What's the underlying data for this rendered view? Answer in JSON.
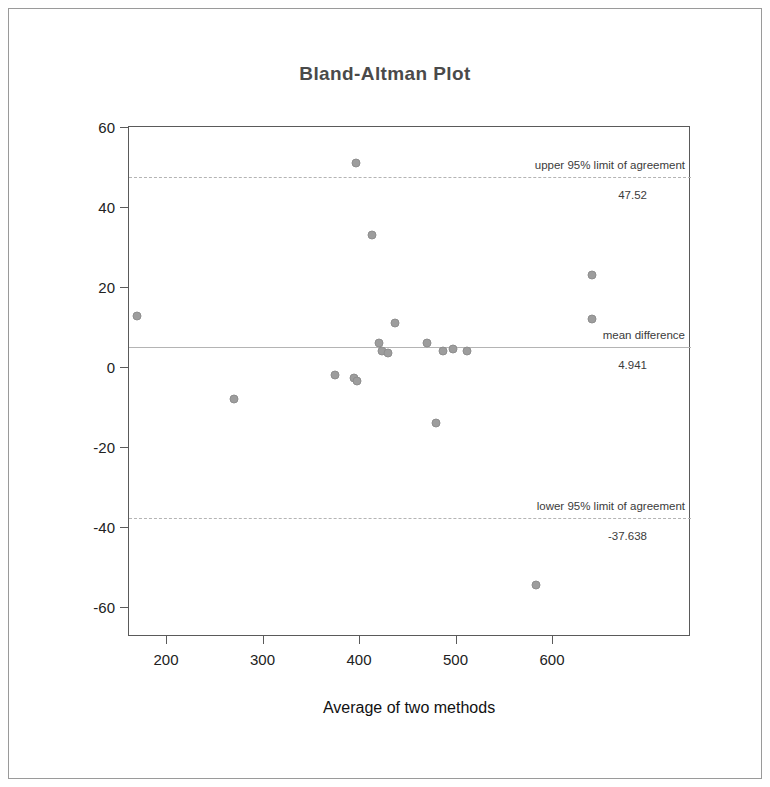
{
  "chart_data": {
    "type": "scatter",
    "title": "Bland-Altman Plot",
    "xlabel": "Average of two methods",
    "ylabel": "Difference between two methods",
    "xlim": [
      130,
      682
    ],
    "ylim": [
      -67,
      62
    ],
    "xticks": [
      200,
      300,
      400,
      500,
      600
    ],
    "yticks": [
      60,
      40,
      20,
      0,
      -20,
      -40,
      -60
    ],
    "grid": false,
    "legend": "none",
    "point_color": "#9d9d9d",
    "line_color": "#b4b4b4",
    "points": [
      {
        "x": 170,
        "y": 12.8
      },
      {
        "x": 270,
        "y": -8.0
      },
      {
        "x": 375,
        "y": -2.0
      },
      {
        "x": 395,
        "y": -2.8
      },
      {
        "x": 398,
        "y": -3.6
      },
      {
        "x": 397,
        "y": 51.0
      },
      {
        "x": 413,
        "y": 33.0
      },
      {
        "x": 421,
        "y": 6.0
      },
      {
        "x": 424,
        "y": 4.0
      },
      {
        "x": 430,
        "y": 3.5
      },
      {
        "x": 437,
        "y": 11.0
      },
      {
        "x": 470,
        "y": 6.0
      },
      {
        "x": 480,
        "y": -14.0
      },
      {
        "x": 487,
        "y": 4.0
      },
      {
        "x": 497,
        "y": 4.5
      },
      {
        "x": 512,
        "y": 4.0
      },
      {
        "x": 583,
        "y": -54.5
      },
      {
        "x": 641,
        "y": 23.0
      },
      {
        "x": 641,
        "y": 12.0
      }
    ],
    "reference_lines": [
      {
        "id": "upper",
        "label": "upper 95% limit of agreement",
        "value": 47.52,
        "value_label": "47.52",
        "style": "dashed"
      },
      {
        "id": "mean",
        "label": "mean difference",
        "value": 4.941,
        "value_label": "4.941",
        "style": "solid"
      },
      {
        "id": "lower",
        "label": "lower 95% limit of agreement",
        "value": -37.638,
        "value_label": "-37.638",
        "style": "dashed"
      }
    ]
  }
}
